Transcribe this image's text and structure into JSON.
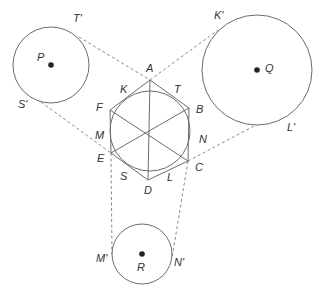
{
  "diagram": {
    "hexagon": {
      "vertices": [
        {
          "name": "A",
          "x": 150,
          "y": 80,
          "label_x": 146,
          "label_y": 72
        },
        {
          "name": "B",
          "x": 189,
          "y": 108,
          "label_x": 196,
          "label_y": 113
        },
        {
          "name": "C",
          "x": 188,
          "y": 161,
          "label_x": 195,
          "label_y": 171
        },
        {
          "name": "D",
          "x": 148,
          "y": 180,
          "label_x": 144,
          "label_y": 194
        },
        {
          "name": "E",
          "x": 111,
          "y": 153,
          "label_x": 97,
          "label_y": 162
        },
        {
          "name": "F",
          "x": 110,
          "y": 110,
          "label_x": 96,
          "label_y": 111
        }
      ]
    },
    "incircle": {
      "cx": 150,
      "cy": 131,
      "r": 40
    },
    "tangent_points": [
      {
        "name": "K",
        "label_x": 120,
        "label_y": 93
      },
      {
        "name": "T",
        "label_x": 174,
        "label_y": 93
      },
      {
        "name": "N",
        "label_x": 199,
        "label_y": 143
      },
      {
        "name": "L",
        "label_x": 167,
        "label_y": 181
      },
      {
        "name": "S",
        "label_x": 120,
        "label_y": 180
      },
      {
        "name": "M",
        "label_x": 95,
        "label_y": 139
      }
    ],
    "circles": [
      {
        "name": "P",
        "cx": 51,
        "cy": 65,
        "r": 38,
        "label_x": 37,
        "label_y": 61,
        "dot_x": 51,
        "dot_y": 65
      },
      {
        "name": "Q",
        "cx": 257,
        "cy": 70,
        "r": 55,
        "label_x": 265,
        "label_y": 72,
        "dot_x": 257,
        "dot_y": 70
      },
      {
        "name": "R",
        "cx": 142,
        "cy": 254,
        "r": 30,
        "label_x": 137,
        "label_y": 271,
        "dot_x": 142,
        "dot_y": 254
      }
    ],
    "outer_points": [
      {
        "name": "T'",
        "x": 79,
        "y": 37,
        "label_x": 73,
        "label_y": 22
      },
      {
        "name": "K'",
        "x": 218,
        "y": 30,
        "label_x": 214,
        "label_y": 19
      },
      {
        "name": "S'",
        "x": 41,
        "y": 102,
        "label_x": 18,
        "label_y": 108
      },
      {
        "name": "L'",
        "x": 256,
        "y": 125,
        "label_x": 287,
        "label_y": 131
      },
      {
        "name": "M'",
        "x": 112,
        "y": 254,
        "label_x": 96,
        "label_y": 262
      },
      {
        "name": "N'",
        "x": 172,
        "y": 258,
        "label_x": 174,
        "label_y": 266
      }
    ],
    "dashed_segments": [
      {
        "from": "T'",
        "to": "A"
      },
      {
        "from": "A",
        "to": "K'"
      },
      {
        "from": "S'",
        "to": "E"
      },
      {
        "from": "C",
        "to": "L'"
      },
      {
        "from": "E",
        "to": "M'"
      },
      {
        "from": "C",
        "to": "N'"
      }
    ],
    "diagonals": [
      {
        "from": "A",
        "to": "D"
      },
      {
        "from": "B",
        "to": "E"
      },
      {
        "from": "C",
        "to": "F"
      }
    ]
  }
}
